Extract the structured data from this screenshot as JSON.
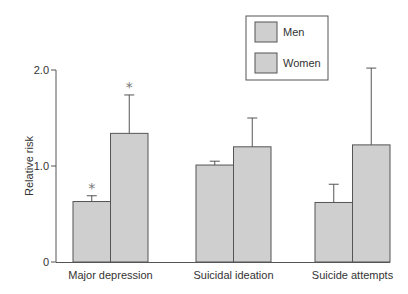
{
  "chart_data": {
    "type": "bar",
    "title": "",
    "xlabel": "",
    "ylabel": "Relative risk",
    "ylim": [
      0,
      2.0
    ],
    "yticks": [
      0,
      1.0,
      2.0
    ],
    "ytick_labels": [
      "0",
      "1.0",
      "2.0"
    ],
    "grid": false,
    "legend_position": "top-right",
    "categories": [
      "Major depression",
      "Suicidal ideation",
      "Suicide attempts"
    ],
    "series": [
      {
        "name": "Men",
        "color": "#cfcfcf",
        "values": [
          0.63,
          1.01,
          0.62
        ],
        "error_upper": [
          0.69,
          1.05,
          0.81
        ],
        "significant": [
          true,
          false,
          false
        ]
      },
      {
        "name": "Women",
        "color": "#cfcfcf",
        "values": [
          1.34,
          1.2,
          1.22
        ],
        "error_upper": [
          1.74,
          1.5,
          2.02
        ],
        "significant": [
          true,
          false,
          false
        ]
      }
    ],
    "annotation_symbol": "*"
  }
}
